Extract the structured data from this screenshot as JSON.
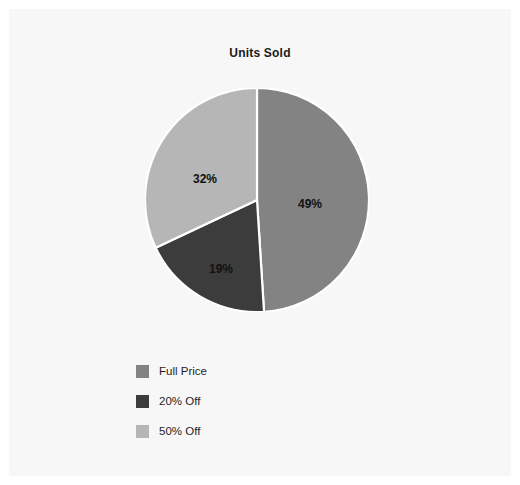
{
  "chart_data": {
    "type": "pie",
    "title": "Units Sold",
    "categories": [
      "Full Price",
      "20% Off",
      "50% Off"
    ],
    "values": [
      49,
      19,
      32
    ],
    "data_labels": [
      "49%",
      "19%",
      "32%"
    ],
    "colors": [
      "#838383",
      "#3c3c3c",
      "#b6b6b6"
    ],
    "start_angle_deg": 0,
    "direction": "clockwise",
    "legend_position": "bottom-left",
    "grid": false,
    "xlabel": "",
    "ylabel": "",
    "background_color": "#f7f7f7",
    "label_text_color": "#111111",
    "slice_border_color": "#ffffff"
  },
  "chart": {
    "title": "Units Sold",
    "labels": {
      "full_price": "49%",
      "off_20": "19%",
      "off_50": "32%"
    }
  },
  "legend": {
    "items": [
      {
        "label": "Full Price",
        "color": "#838383"
      },
      {
        "label": "20% Off",
        "color": "#3c3c3c"
      },
      {
        "label": "50% Off",
        "color": "#b6b6b6"
      }
    ]
  }
}
